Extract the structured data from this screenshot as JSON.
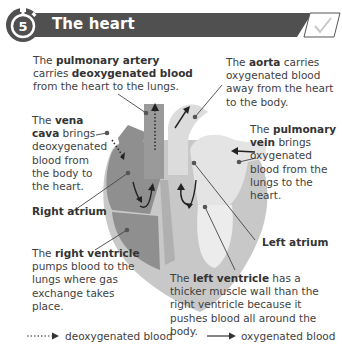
{
  "header": {
    "number": "5",
    "title": "The heart",
    "icons": [
      "stopwatch-icon",
      "checkmark-box-icon"
    ]
  },
  "annotations": {
    "pulmonary_artery": {
      "pre": "The ",
      "bold1": "pulmonary artery",
      "mid": " carries ",
      "bold2": "deoxygenated blood",
      "post": " from the heart to the lungs."
    },
    "aorta": {
      "pre": "The ",
      "bold": "aorta",
      "post": " carries oxygenated blood away from the heart to the body."
    },
    "vena_cava": {
      "pre": "The ",
      "bold": "vena cava",
      "post": " brings deoxygenated blood from the body to the heart."
    },
    "pulmonary_vein": {
      "pre": "The ",
      "bold": "pulmonary vein",
      "post": " brings oxygenated blood from the lungs to the heart."
    },
    "right_atrium": "Right atrium",
    "left_atrium": "Left atrium",
    "right_ventricle": {
      "pre": "The ",
      "bold": "right ventricle",
      "post": " pumps blood to the lungs where gas exchange takes place."
    },
    "left_ventricle": {
      "pre": "The ",
      "bold": "left ventricle",
      "post": " has a thicker muscle wall than the right ventricle because it pushes blood all around the body."
    }
  },
  "legend": {
    "deoxygenated": "deoxygenated blood",
    "oxygenated": "oxygenated blood"
  },
  "colors": {
    "header_bg": "#505050",
    "dark_grey": "#8a8a8a",
    "mid_grey": "#b4b4b4",
    "light_grey": "#e2e2e2",
    "text": "#3f3f3f"
  }
}
